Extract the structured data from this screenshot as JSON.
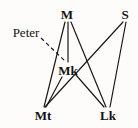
{
  "diagram": {
    "type": "node-link-graph",
    "width": 138,
    "height": 128,
    "background_color": "#fdfcfa",
    "ink_color": "#1a1a1a",
    "nodes": [
      {
        "id": "M",
        "label": "M",
        "x": 67,
        "y": 14,
        "style": "bold"
      },
      {
        "id": "S",
        "label": "S",
        "x": 125,
        "y": 14,
        "style": "bold"
      },
      {
        "id": "Mk",
        "label": "Mk",
        "x": 68,
        "y": 70,
        "style": "bold"
      },
      {
        "id": "Mt",
        "label": "Mt",
        "x": 43,
        "y": 115,
        "style": "bold"
      },
      {
        "id": "Lk",
        "label": "Lk",
        "x": 108,
        "y": 115,
        "style": "bold"
      }
    ],
    "annotations": [
      {
        "id": "peter",
        "label": "Peter",
        "x": 26,
        "y": 32,
        "style": "plain"
      }
    ],
    "edges": [
      {
        "from": "M",
        "to": "Mt",
        "x1": 65,
        "y1": 22,
        "x2": 44,
        "y2": 107,
        "dashed": false
      },
      {
        "from": "M",
        "to": "Mk",
        "x1": 68,
        "y1": 22,
        "x2": 68,
        "y2": 62,
        "dashed": false
      },
      {
        "from": "M",
        "to": "Lk",
        "x1": 71,
        "y1": 22,
        "x2": 106,
        "y2": 107,
        "dashed": false
      },
      {
        "from": "S",
        "to": "Mt",
        "x1": 123,
        "y1": 22,
        "x2": 45,
        "y2": 107,
        "dashed": false
      },
      {
        "from": "S",
        "to": "Lk",
        "x1": 126,
        "y1": 22,
        "x2": 110,
        "y2": 107,
        "dashed": false
      },
      {
        "from": "Mk",
        "to": "Mt",
        "x1": 62,
        "y1": 77,
        "x2": 46,
        "y2": 107,
        "dashed": false
      },
      {
        "from": "Mk",
        "to": "Lk",
        "x1": 76,
        "y1": 75,
        "x2": 104,
        "y2": 107,
        "dashed": false
      }
    ],
    "dashed_edges": [
      {
        "from": "peter",
        "to": "Mk",
        "x1": 41,
        "y1": 38,
        "x2": 66,
        "y2": 62,
        "dashed": true
      }
    ]
  }
}
